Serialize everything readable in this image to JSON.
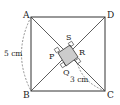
{
  "diagram": {
    "type": "geometry",
    "vertices": {
      "A": "A",
      "B": "B",
      "C": "C",
      "D": "D",
      "P": "P",
      "Q": "Q",
      "R": "R",
      "S": "S"
    },
    "measurements": {
      "side": "5 cm",
      "segment": "3 cm"
    },
    "colors": {
      "line": "#333333",
      "shaded": "#cccccc",
      "dashed": "#666666"
    }
  }
}
